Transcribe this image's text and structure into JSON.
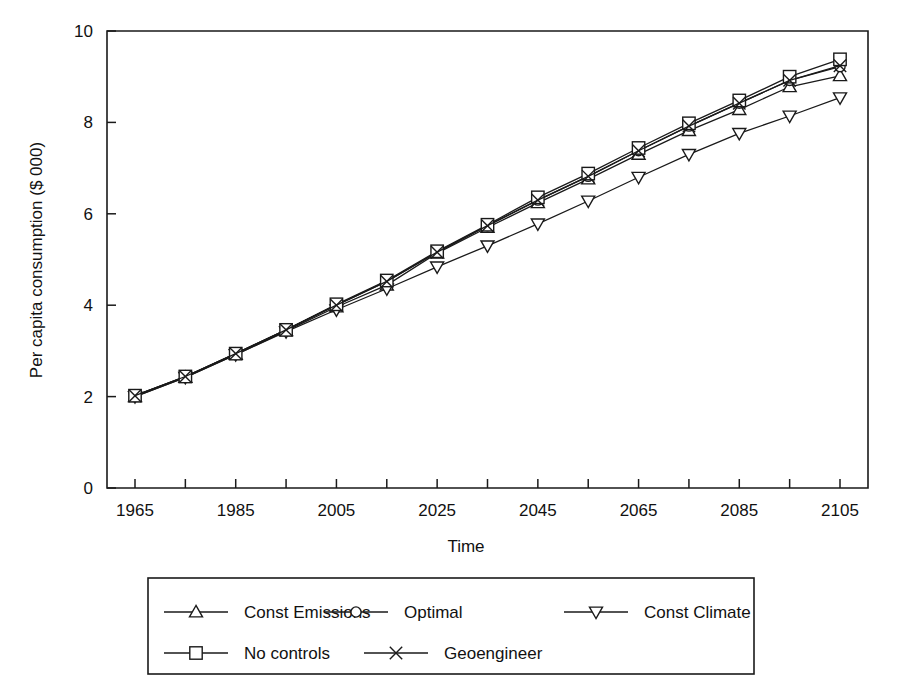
{
  "chart_data": {
    "type": "line",
    "title": "",
    "xlabel": "Time",
    "ylabel": "Per capita consumption ($ 000)",
    "xlim": [
      1965,
      2105
    ],
    "ylim": [
      0,
      10
    ],
    "xticks": [
      1965,
      1985,
      2005,
      2025,
      2045,
      2065,
      2085,
      2105
    ],
    "xtick_labels": [
      "1965",
      "1985",
      "2005",
      "2025",
      "2045",
      "2065",
      "2085",
      "2105"
    ],
    "minor_xtick_step": 10,
    "yticks": [
      0,
      2,
      4,
      6,
      8,
      10
    ],
    "ytick_labels": [
      "0",
      "2",
      "4",
      "6",
      "8",
      "10"
    ],
    "grid": false,
    "legend_position": "below-outside",
    "x": [
      1965,
      1975,
      1985,
      1995,
      2005,
      2015,
      2025,
      2035,
      2045,
      2055,
      2065,
      2075,
      2085,
      2095,
      2105
    ],
    "series": [
      {
        "name": "Const Emissions",
        "marker": "triangle-up",
        "values": [
          2.0,
          2.42,
          2.92,
          3.44,
          3.96,
          4.44,
          5.14,
          5.7,
          6.24,
          6.76,
          7.3,
          7.82,
          8.28,
          8.78,
          9.02
        ]
      },
      {
        "name": "Optimal",
        "marker": "circle",
        "values": [
          2.02,
          2.44,
          2.94,
          3.46,
          4.0,
          4.52,
          5.16,
          5.74,
          6.3,
          6.82,
          7.38,
          7.92,
          8.42,
          8.92,
          9.22
        ]
      },
      {
        "name": "Const Climate",
        "marker": "triangle-down",
        "values": [
          2.0,
          2.42,
          2.92,
          3.42,
          3.9,
          4.36,
          4.84,
          5.3,
          5.78,
          6.28,
          6.8,
          7.3,
          7.76,
          8.14,
          8.54
        ]
      },
      {
        "name": "No controls",
        "marker": "square",
        "values": [
          2.02,
          2.44,
          2.94,
          3.46,
          4.02,
          4.54,
          5.18,
          5.76,
          6.36,
          6.88,
          7.44,
          7.98,
          8.48,
          9.0,
          9.38
        ]
      },
      {
        "name": "Geoengineer",
        "marker": "cross-x",
        "values": [
          2.02,
          2.44,
          2.94,
          3.46,
          4.0,
          4.52,
          5.16,
          5.74,
          6.3,
          6.82,
          7.38,
          7.92,
          8.42,
          8.92,
          9.24
        ]
      }
    ]
  },
  "legend": {
    "rows": [
      [
        {
          "label": "Const Emissions",
          "marker": "triangle-up"
        },
        {
          "label": "Optimal",
          "marker": "circle"
        },
        {
          "label": "Const Climate",
          "marker": "triangle-down"
        }
      ],
      [
        {
          "label": "No controls",
          "marker": "square"
        },
        {
          "label": "Geoengineer",
          "marker": "cross-x"
        }
      ]
    ]
  },
  "colors": {
    "ink": "#1a1a1a",
    "paper": "#ffffff"
  }
}
